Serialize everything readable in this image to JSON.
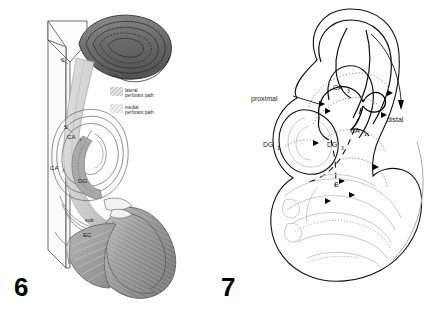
{
  "plate": {
    "panels": [
      {
        "number": "6",
        "type": "shaded-anatomical-rendering",
        "description": "Three-dimensional shaded drawing of the rat hippocampal formation with perforant path projections",
        "legend": {
          "entries": [
            {
              "swatch": "lateral-perforant-path-swatch",
              "line1": "lateral",
              "line2": "perforant path",
              "color": "#b9b9b9"
            },
            {
              "swatch": "medial-perforant-path-swatch",
              "line1": "medial",
              "line2": "perforant path",
              "color": "#cfcfcf"
            }
          ]
        },
        "labels": [
          {
            "name": "label-s-upper",
            "text": "S",
            "x": 63,
            "y": 61
          },
          {
            "name": "label-s-lower",
            "text": "S",
            "x": 67,
            "y": 128
          },
          {
            "name": "label-ca3",
            "text": "CA",
            "sub": "3",
            "x": 69,
            "y": 137
          },
          {
            "name": "label-ca1",
            "text": "CA",
            "sub": "1",
            "x": 53,
            "y": 168
          },
          {
            "name": "label-dg",
            "text": "DG",
            "x": 81,
            "y": 181
          },
          {
            "name": "label-sub",
            "text": "sub",
            "x": 88,
            "y": 220
          },
          {
            "name": "label-ec",
            "text": "EC",
            "x": 86,
            "y": 235
          }
        ]
      },
      {
        "number": "7",
        "type": "line-drawing-schematic",
        "description": "Unfolded schematic line drawing of hippocampal subfields with proximal to distal axis",
        "labels": [
          {
            "name": "label-proximal",
            "text": "proximal",
            "x": 42,
            "y": 99
          },
          {
            "name": "label-distal",
            "text": "distal",
            "x": 175,
            "y": 118
          },
          {
            "name": "label-ca3",
            "text": "CA",
            "sub": "3",
            "x": 115,
            "y": 88
          },
          {
            "name": "label-ca1",
            "text": "CA",
            "sub": "1",
            "x": 132,
            "y": 131
          },
          {
            "name": "label-dg1",
            "text": "DG",
            "sub": "1",
            "x": 46,
            "y": 145
          },
          {
            "name": "label-dg3",
            "text": "DG",
            "sub": "3",
            "x": 110,
            "y": 145
          },
          {
            "name": "label-s",
            "text": "S",
            "x": 115,
            "y": 185
          }
        ]
      }
    ]
  },
  "colors": {
    "background": "#ffffff",
    "ink_black": "#000000",
    "ink_gray": "#8c8c8c",
    "ink_light_gray": "#c4c4c4",
    "shade_dark": "#6e6e6e",
    "shade_mid": "#a5a5a5",
    "shade_light": "#d8d8d8",
    "shade_pale": "#ededed"
  }
}
